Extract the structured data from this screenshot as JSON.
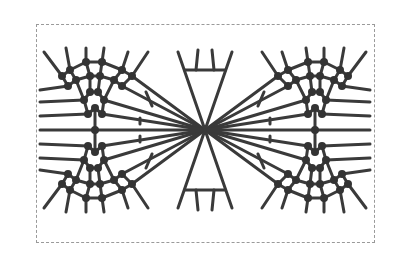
{
  "diagram": {
    "colors": {
      "line": "#3a3a3a",
      "node": "#333333",
      "frame": "#9a9a9a",
      "background": "#ffffff"
    },
    "center": [
      205,
      130
    ],
    "frame": {
      "x": 36,
      "y": 24,
      "width": 339,
      "height": 219
    }
  }
}
